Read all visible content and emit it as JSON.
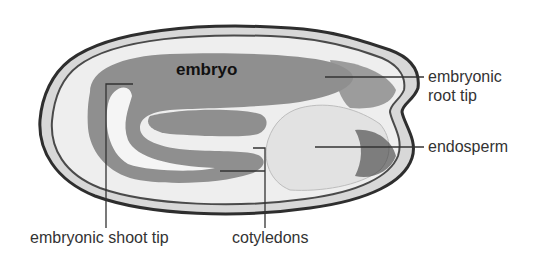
{
  "diagram": {
    "labels": {
      "embryo": "embryo",
      "root_tip_line1": "embryonic",
      "root_tip_line2": "root tip",
      "endosperm": "endosperm",
      "shoot_tip": "embryonic shoot tip",
      "cotyledons": "cotyledons"
    },
    "colors": {
      "embryo_fill": "#8f8f8f",
      "seed_coat": "#3a3a3a",
      "endosperm_fill": "#e6e6e6",
      "leader_line": "#333333",
      "label_text": "#333333"
    }
  }
}
